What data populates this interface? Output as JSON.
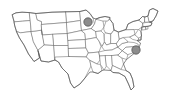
{
  "figure": {
    "background_color": "#ffffff",
    "width": 174,
    "height": 101,
    "border_color": "#6b6b6b",
    "fill_color": "#ffffff"
  },
  "chart_data": {
    "type": "map",
    "subtitle": "",
    "xlabel": "",
    "ylabel": "",
    "projection": "contiguous-united-states",
    "grid": false,
    "legend": false,
    "legend_position": "none",
    "tick_labels": [],
    "annotations": [],
    "region_outline_color": "#6b6b6b",
    "region_fill_color": "#ffffff",
    "marker_fill_color": "#8c8c8c",
    "marker_outline_color": "#4a4a4a",
    "markers": [
      {
        "id": "marker-upper-midwest",
        "label": "",
        "region": "Upper Midwest",
        "x": 88,
        "y": 22,
        "radius": 4.2,
        "fill": "#8c8c8c",
        "stroke": "#4a4a4a"
      },
      {
        "id": "marker-mid-atlantic",
        "label": "",
        "region": "Mid-Atlantic",
        "x": 136,
        "y": 50,
        "radius": 4.2,
        "fill": "#8c8c8c",
        "stroke": "#4a4a4a"
      }
    ],
    "marker_count": 2
  }
}
